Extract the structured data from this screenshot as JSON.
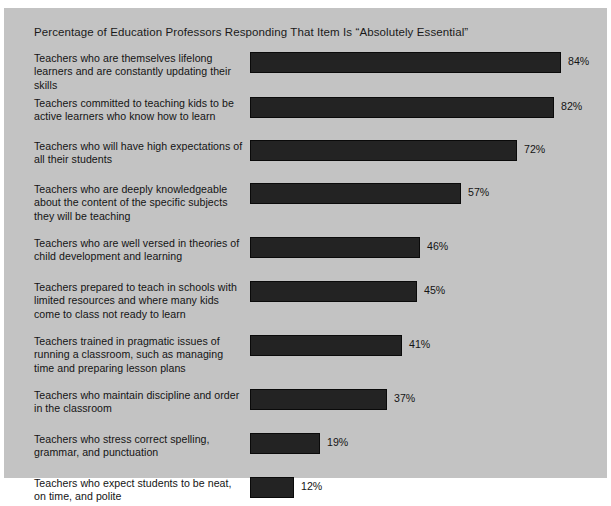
{
  "chart_data": {
    "type": "bar",
    "orientation": "horizontal",
    "title": "Percentage of Education Professors Responding That Item Is “Absolutely Essential”",
    "xlabel": "",
    "ylabel": "",
    "xlim": [
      0,
      100
    ],
    "grid": false,
    "legend": null,
    "value_suffix": "%",
    "categories": [
      "Teachers who are themselves lifelong learners and are constantly updating their skills",
      "Teachers committed to teaching kids to be active learners who know how to learn",
      "Teachers who will have high expectations of all their students",
      "Teachers who are deeply knowledgeable about the content of the specific subjects they will be teaching",
      "Teachers who are well versed in theories of child development and learning",
      "Teachers prepared to teach in schools with limited resources and where many kids come to class not ready to learn",
      "Teachers trained in pragmatic issues of running a classroom, such as managing time and preparing lesson plans",
      "Teachers who maintain discipline and order in the classroom",
      "Teachers who stress correct spelling, grammar, and punctuation",
      "Teachers who expect students to be neat, on time, and polite"
    ],
    "values": [
      84,
      82,
      72,
      57,
      46,
      45,
      41,
      37,
      19,
      12
    ],
    "value_labels": [
      "84%",
      "82%",
      "72%",
      "57%",
      "46%",
      "45%",
      "41%",
      "37%",
      "19%",
      "12%"
    ]
  },
  "colors": {
    "panel_background": "#c3c3c3",
    "bar_fill": "#232323",
    "bar_border": "#0a0a0a",
    "text": "#141414",
    "page_background": "#ffffff"
  },
  "rows": [
    {
      "label": "Teachers who are themselves lifelong learners and are constantly updating their skills",
      "value_label": "84%",
      "value": 84,
      "bar_px": 311,
      "row_top": 0,
      "row_height": 45,
      "label_lines": 2
    },
    {
      "label": "Teachers committed to teaching kids to be active learners who know how to learn",
      "value_label": "82%",
      "value": 82,
      "bar_px": 304,
      "row_top": 45,
      "row_height": 43,
      "label_lines": 2
    },
    {
      "label": "Teachers who will have high expectations of all their students",
      "value_label": "72%",
      "value": 72,
      "bar_px": 267,
      "row_top": 88,
      "row_height": 43,
      "label_lines": 2
    },
    {
      "label": "Teachers who are deeply knowledgeable about the content of the specific subjects they will be teaching",
      "value_label": "57%",
      "value": 57,
      "bar_px": 211,
      "row_top": 131,
      "row_height": 54,
      "label_lines": 3
    },
    {
      "label": "Teachers who are well versed in theories of child development and learning",
      "value_label": "46%",
      "value": 46,
      "bar_px": 170,
      "row_top": 185,
      "row_height": 44,
      "label_lines": 2
    },
    {
      "label": "Teachers prepared to teach in schools with limited resources and where many kids come to class not ready to learn",
      "value_label": "45%",
      "value": 45,
      "bar_px": 167,
      "row_top": 229,
      "row_height": 54,
      "label_lines": 3
    },
    {
      "label": "Teachers trained in pragmatic issues of running a classroom, such as managing time and preparing lesson plans",
      "value_label": "41%",
      "value": 41,
      "bar_px": 152,
      "row_top": 283,
      "row_height": 54,
      "label_lines": 3
    },
    {
      "label": "Teachers who maintain discipline and order in the classroom",
      "value_label": "37%",
      "value": 37,
      "bar_px": 137,
      "row_top": 337,
      "row_height": 44,
      "label_lines": 2
    },
    {
      "label": "Teachers who stress correct spelling, grammar, and punctuation",
      "value_label": "19%",
      "value": 19,
      "bar_px": 70,
      "row_top": 381,
      "row_height": 44,
      "label_lines": 2
    },
    {
      "label": "Teachers who expect students to be neat, on time, and polite",
      "value_label": "12%",
      "value": 12,
      "bar_px": 44,
      "row_top": 425,
      "row_height": 44,
      "label_lines": 2
    }
  ]
}
